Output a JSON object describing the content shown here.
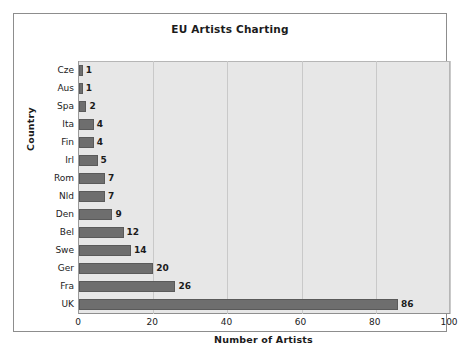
{
  "chart_data": {
    "type": "bar",
    "orientation": "horizontal",
    "title": "EU Artists Charting",
    "xlabel": "Number of Artists",
    "ylabel": "Country",
    "categories": [
      "Cze",
      "Aus",
      "Spa",
      "Ita",
      "Fin",
      "Irl",
      "Rom",
      "Nld",
      "Den",
      "Bel",
      "Swe",
      "Ger",
      "Fra",
      "UK"
    ],
    "values": [
      1,
      1,
      2,
      4,
      4,
      5,
      7,
      7,
      9,
      12,
      14,
      20,
      26,
      86
    ],
    "data_labels": [
      "1",
      "1",
      "2",
      "4",
      "4",
      "5",
      "7",
      "7",
      "9",
      "12",
      "14",
      "20",
      "26",
      "86"
    ],
    "xlim": [
      0,
      100
    ],
    "xticks": [
      0,
      20,
      40,
      60,
      80,
      100
    ],
    "xtick_labels": [
      "0",
      "20",
      "40",
      "60",
      "80",
      "100"
    ],
    "grid": "vertical",
    "legend": "none",
    "colors": {
      "bar_fill": "#6e6e6e",
      "bar_edge": "#5a5a5a",
      "plot_background": "#e7e7e7",
      "gridline": "#c9c9c9",
      "axis_line": "#8f8f8f",
      "text": "#1b1b1b",
      "page_background": "#ffffff",
      "frame_border": "#8d8d8d"
    }
  }
}
